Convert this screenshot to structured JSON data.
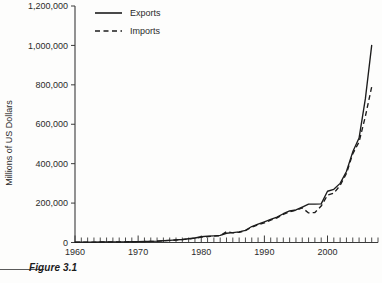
{
  "figure": {
    "caption": "Figure 3.1"
  },
  "chart_data": {
    "type": "line",
    "title": "",
    "xlabel": "",
    "ylabel": "Millions of US Dollars",
    "xlim": [
      1960,
      2008
    ],
    "ylim": [
      0,
      1200000
    ],
    "grid": false,
    "legend_position": "top-left",
    "x_tick_labels": [
      "1960",
      "1970",
      "1980",
      "1990",
      "2000"
    ],
    "x_tick_values": [
      1960,
      1970,
      1980,
      1990,
      2000
    ],
    "x_minor_tick_interval": 1,
    "y_tick_labels": [
      "0",
      "200,000",
      "400,000",
      "600,000",
      "800,000",
      "1,000,000",
      "1,200,000"
    ],
    "y_tick_values": [
      0,
      200000,
      400000,
      600000,
      800000,
      1000000,
      1200000
    ],
    "x": [
      1960,
      1961,
      1962,
      1963,
      1964,
      1965,
      1966,
      1967,
      1968,
      1969,
      1970,
      1971,
      1972,
      1973,
      1974,
      1975,
      1976,
      1977,
      1978,
      1979,
      1980,
      1981,
      1982,
      1983,
      1984,
      1985,
      1986,
      1987,
      1988,
      1989,
      1990,
      1991,
      1992,
      1993,
      1994,
      1995,
      1996,
      1997,
      1998,
      1999,
      2000,
      2001,
      2002,
      2003,
      2004,
      2005,
      2006,
      2007
    ],
    "series": [
      {
        "name": "Exports",
        "style": "solid",
        "color": "#1c1c1c",
        "values": [
          1900,
          2000,
          2100,
          2300,
          2600,
          2800,
          3000,
          3200,
          3500,
          3900,
          4400,
          5000,
          5500,
          6700,
          9000,
          11000,
          13000,
          15000,
          19000,
          23000,
          29000,
          32000,
          34000,
          36000,
          47000,
          50000,
          54000,
          62000,
          81000,
          93000,
          105000,
          117000,
          129000,
          146000,
          160000,
          165000,
          180000,
          195000,
          195000,
          196000,
          260000,
          270000,
          300000,
          360000,
          460000,
          530000,
          730000,
          1000000
        ]
      },
      {
        "name": "Imports",
        "style": "dashed",
        "color": "#1c1c1c",
        "values": [
          1800,
          1900,
          2000,
          2200,
          2400,
          2700,
          2900,
          3100,
          3400,
          3800,
          4200,
          4800,
          5400,
          6500,
          8800,
          10500,
          12500,
          14500,
          18000,
          22000,
          27000,
          30000,
          32000,
          34000,
          55000,
          49000,
          52000,
          60000,
          78000,
          90000,
          100000,
          113000,
          125000,
          143000,
          156000,
          164000,
          176000,
          150000,
          152000,
          185000,
          240000,
          250000,
          290000,
          350000,
          450000,
          510000,
          640000,
          790000
        ]
      }
    ],
    "legend": [
      {
        "label": "Exports",
        "style": "solid"
      },
      {
        "label": "Imports",
        "style": "dashed"
      }
    ]
  }
}
